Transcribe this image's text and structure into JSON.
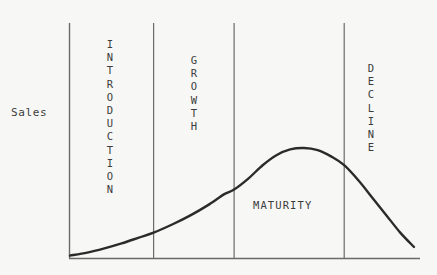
{
  "diagram": {
    "background_color": "#f7f7f5",
    "ink_color": "#3c3c3c",
    "curve_color": "#2b2b2b",
    "axis_color": "#6a6a6a",
    "y_axis_label": "Sales",
    "stages": [
      {
        "name": "INTRODUCTION",
        "orientation": "vertical",
        "label": "INTRODUCTION"
      },
      {
        "name": "GROWTH",
        "orientation": "vertical",
        "label": "GROWTH"
      },
      {
        "name": "MATURITY",
        "orientation": "horizontal",
        "label": "MATURITY"
      },
      {
        "name": "DECLINE",
        "orientation": "vertical",
        "label": "DECLINE"
      }
    ]
  },
  "chart_data": {
    "type": "line",
    "title": "",
    "xlabel": "",
    "ylabel": "Sales",
    "grid": false,
    "legend": "none",
    "axis_ranges": {
      "x": [
        0,
        100
      ],
      "y": [
        0,
        100
      ]
    },
    "divider_positions_pct": [
      24.3,
      47.7,
      79.7
    ],
    "series": [
      {
        "name": "Sales",
        "x": [
          0,
          5,
          10,
          15,
          20,
          24.3,
          30,
          35,
          40,
          45,
          47.7,
          52,
          56,
          60,
          64,
          68,
          72,
          76,
          79.7,
          84,
          88,
          92,
          96,
          100
        ],
        "y": [
          1,
          3,
          6,
          9.5,
          13.5,
          17,
          23,
          29,
          36,
          44,
          47,
          55,
          64,
          71,
          75,
          76,
          74.5,
          70,
          64,
          53,
          41,
          29,
          17,
          7
        ]
      }
    ],
    "stage_boundaries": [
      {
        "stage": "INTRODUCTION",
        "x_start": 0,
        "x_end": 24.3
      },
      {
        "stage": "GROWTH",
        "x_start": 24.3,
        "x_end": 47.7
      },
      {
        "stage": "MATURITY",
        "x_start": 47.7,
        "x_end": 79.7
      },
      {
        "stage": "DECLINE",
        "x_start": 79.7,
        "x_end": 100
      }
    ],
    "annotations": [
      {
        "text": "Sales",
        "role": "y-axis-title"
      },
      {
        "text": "INTRODUCTION",
        "role": "stage-label"
      },
      {
        "text": "GROWTH",
        "role": "stage-label"
      },
      {
        "text": "MATURITY",
        "role": "stage-label"
      },
      {
        "text": "DECLINE",
        "role": "stage-label"
      }
    ]
  }
}
